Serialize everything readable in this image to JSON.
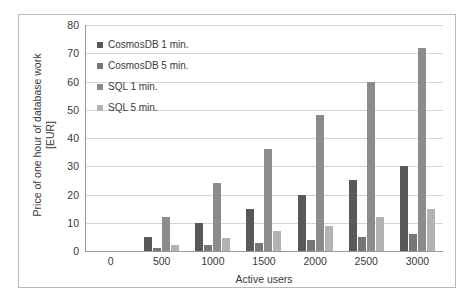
{
  "chart_data": {
    "type": "bar",
    "title": "",
    "xlabel": "Active users",
    "ylabel": "Price of one hour of database work [EUR]",
    "ylabel_lines": [
      "Price of one hour of database work",
      "[EUR]"
    ],
    "categories": [
      "0",
      "500",
      "1000",
      "1500",
      "2000",
      "2500",
      "3000"
    ],
    "ylim": [
      0,
      80
    ],
    "yticks": [
      0,
      10,
      20,
      30,
      40,
      50,
      60,
      70,
      80
    ],
    "grid": true,
    "legend_position": "inside-top-left",
    "series": [
      {
        "name": "CosmosDB 1 min.",
        "color": "#595959",
        "values": [
          0,
          5,
          10,
          15,
          20,
          25,
          30
        ]
      },
      {
        "name": "CosmosDB 5 min.",
        "color": "#767676",
        "values": [
          0,
          1,
          2,
          3,
          4,
          5,
          6
        ]
      },
      {
        "name": "SQL 1 min.",
        "color": "#8c8c8c",
        "values": [
          0,
          12,
          24,
          36,
          48,
          60,
          72
        ]
      },
      {
        "name": "SQL 5 min.",
        "color": "#b3b3b3",
        "values": [
          0,
          2,
          4.5,
          7,
          9,
          12,
          15
        ]
      }
    ]
  },
  "colors": {
    "grid": "#d4d4d4",
    "axis": "#9a9a9a",
    "text": "#3a3a3a",
    "frame": "#b9b9b9"
  }
}
